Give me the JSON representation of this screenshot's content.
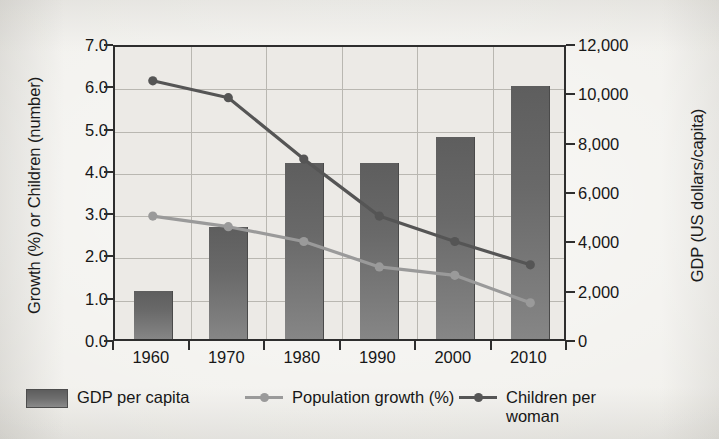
{
  "chart_data": {
    "type": "bar",
    "title": "",
    "subtitle": "",
    "categories": [
      "1960",
      "1970",
      "1980",
      "1990",
      "2000",
      "2010"
    ],
    "xlabel": "",
    "ylabel": "Growth (%) or Children (number)",
    "ylabel_secondary": "GDP (US dollars/capita)",
    "ylim": [
      0,
      7
    ],
    "ylim_secondary": [
      0,
      12000
    ],
    "yticks": [
      "0.0",
      "1.0",
      "2.0",
      "3.0",
      "4.0",
      "5.0",
      "6.0",
      "7.0"
    ],
    "yticks_secondary": [
      "0",
      "2,000",
      "4,000",
      "6,000",
      "8,000",
      "10,000",
      "12,000"
    ],
    "grid": true,
    "legend_position": "bottom",
    "series": [
      {
        "name": "GDP per capita",
        "kind": "bar",
        "axis": "right",
        "units": "US dollars/capita",
        "color": "#6b6b6b",
        "values": [
          1950,
          4550,
          7150,
          7150,
          8200,
          10250
        ]
      },
      {
        "name": "Population growth (%)",
        "kind": "line",
        "axis": "left",
        "units": "%",
        "color": "#9a9a9a",
        "values": [
          3.0,
          2.75,
          2.4,
          1.8,
          1.6,
          0.95
        ]
      },
      {
        "name": "Children per woman",
        "kind": "line",
        "axis": "left",
        "units": "number",
        "color": "#555555",
        "values": [
          6.2,
          5.8,
          4.35,
          3.0,
          2.4,
          1.85
        ]
      }
    ]
  },
  "legend": {
    "items": [
      {
        "label": "GDP per capita",
        "marker": "bar-swatch",
        "color": "#6b6b6b"
      },
      {
        "label": "Population growth (%)",
        "marker": "line-marker",
        "color": "#9a9a9a"
      },
      {
        "label": "Children per\nwoman",
        "marker": "line-marker",
        "color": "#555555"
      }
    ]
  },
  "colors": {
    "background": "#f1f0ec",
    "plot_background": "#eceae6",
    "axis": "#2e2e2e",
    "grid": "#b9b7b1",
    "bar": "#6b6b6b",
    "line_population": "#9a9a9a",
    "line_children": "#555555",
    "text": "#171717"
  }
}
